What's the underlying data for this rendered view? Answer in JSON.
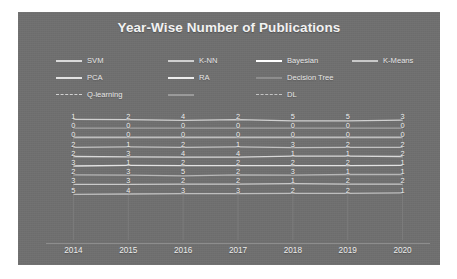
{
  "chart_data": {
    "type": "line",
    "title": "Year-Wise Number of Publications",
    "xlabel": "",
    "ylabel": "",
    "categories": [
      "2014",
      "2015",
      "2016",
      "2017",
      "2018",
      "2019",
      "2020"
    ],
    "grid": "vertical",
    "legend_position": "top",
    "series": [
      {
        "name": "SVM",
        "color": "#d9d9d9",
        "values": [
          1,
          2,
          4,
          2,
          5,
          5,
          3
        ]
      },
      {
        "name": "K-NN",
        "color": "#cfcfcf",
        "values": [
          0,
          0,
          0,
          0,
          0,
          0,
          0
        ]
      },
      {
        "name": "Bayesian",
        "color": "#ffffff",
        "values": [
          0,
          0,
          0,
          0,
          0,
          0,
          0
        ]
      },
      {
        "name": "K-Means",
        "color": "#c8c8c8",
        "values": [
          2,
          1,
          2,
          1,
          3,
          2,
          2
        ]
      },
      {
        "name": "PCA",
        "color": "#e2e2e2",
        "values": [
          2,
          3,
          4,
          4,
          1,
          1,
          2
        ]
      },
      {
        "name": "RA",
        "color": "#ededed",
        "values": [
          3,
          1,
          2,
          2,
          2,
          2,
          1
        ]
      },
      {
        "name": "Decision Tree",
        "color": "#bdbdbd",
        "values": [
          2,
          3,
          5,
          2,
          3,
          1,
          1
        ]
      },
      {
        "name": "Q-learning",
        "color": "#d2d2d2",
        "values": [
          3,
          3,
          2,
          2,
          1,
          2,
          2
        ]
      },
      {
        "name": "DL",
        "color": "#c4c4c4",
        "values": [
          5,
          4,
          3,
          3,
          2,
          2,
          1
        ]
      }
    ],
    "data_labels": [
      [
        "1",
        "0",
        "0",
        "2",
        "2",
        "3",
        "2",
        "3",
        "5"
      ],
      [
        "2",
        "0",
        "0",
        "1",
        "3",
        "1",
        "3",
        "3",
        "4"
      ],
      [
        "4",
        "0",
        "0",
        "2",
        "4",
        "2",
        "5",
        "2",
        "3"
      ],
      [
        "2",
        "0",
        "0",
        "1",
        "4",
        "2",
        "2",
        "2",
        "3"
      ],
      [
        "5",
        "0",
        "0",
        "3",
        "1",
        "2",
        "3",
        "1",
        "2"
      ],
      [
        "5",
        "0",
        "0",
        "2",
        "1",
        "2",
        "1",
        "2",
        "2"
      ],
      [
        "3",
        "0",
        "0",
        "2",
        "2",
        "1",
        "1",
        "2",
        "1"
      ]
    ]
  },
  "legend": {
    "rows": [
      [
        {
          "label": "SVM",
          "color": "#d9d9d9",
          "style": "solid"
        },
        {
          "label": "K-NN",
          "color": "#cfcfcf",
          "style": "solid"
        },
        {
          "label": "Bayesian",
          "color": "#ffffff",
          "style": "solid"
        },
        {
          "label": "K-Means",
          "color": "#c8c8c8",
          "style": "solid"
        }
      ],
      [
        {
          "label": "PCA",
          "color": "#e2e2e2",
          "style": "solid"
        },
        {
          "label": "RA",
          "color": "#ededed",
          "style": "solid"
        },
        {
          "label": "Decision Tree",
          "color": "#8d8d8d",
          "style": "solid"
        },
        {
          "label": "",
          "color": "#8d8d8d",
          "style": "none"
        }
      ],
      [
        {
          "label": "Q-learning",
          "color": "#d2d2d2",
          "style": "dashed"
        },
        {
          "label": "",
          "color": "#9a9a9a",
          "style": "solid"
        },
        {
          "label": "DL",
          "color": "#c4c4c4",
          "style": "dashed"
        },
        {
          "label": "",
          "color": "#8d8d8d",
          "style": "none"
        }
      ]
    ]
  },
  "colors": {
    "panel_background": "#6f6f6f",
    "page_background": "#ffffff",
    "title_text": "#f2f2f2",
    "axis_text": "#ededed",
    "gridline": "#7c7c7c"
  }
}
